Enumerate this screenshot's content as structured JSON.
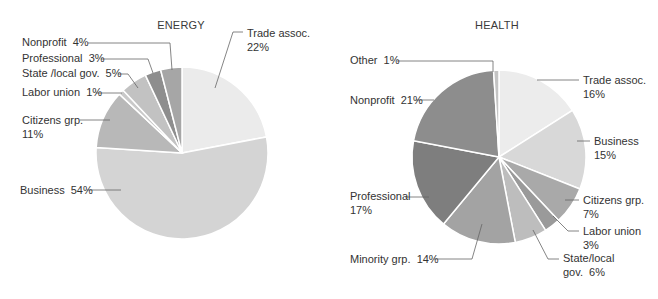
{
  "chart_data": [
    {
      "type": "pie",
      "title": "ENERGY",
      "center": [
        182,
        153
      ],
      "radius": 86,
      "start_angle_deg": 0,
      "direction": "clockwise",
      "slices": [
        {
          "label": "Trade assoc.",
          "value": 22,
          "color": "#ebebeb",
          "text": [
            "Trade assoc.",
            "22%"
          ],
          "label_pos": [
            247,
            37
          ],
          "leader": [
            [
              243,
              32
            ],
            [
              233,
              32
            ],
            [
              215,
              88
            ]
          ]
        },
        {
          "label": "Business",
          "value": 54,
          "color": "#d4d4d4",
          "text": [
            "Business  54%"
          ],
          "label_pos": [
            20,
            194
          ],
          "leader": [
            [
              87,
              190
            ],
            [
              121,
              190
            ]
          ]
        },
        {
          "label": "Citizens grp.",
          "value": 11,
          "color": "#b8b8b8",
          "text": [
            "Citizens grp.",
            "11%"
          ],
          "label_pos": [
            22,
            124
          ],
          "leader": [
            [
              80,
              120
            ],
            [
              110,
              120
            ]
          ]
        },
        {
          "label": "Labor union",
          "value": 1,
          "color": "#c9c9c9",
          "text": [
            "Labor union  1%"
          ],
          "label_pos": [
            22,
            96
          ],
          "leader": [
            [
              96,
              93
            ],
            [
              122,
              93
            ]
          ]
        },
        {
          "label": "State /local gov.",
          "value": 5,
          "color": "#c2c2c2",
          "text": [
            "State /local gov.  5%"
          ],
          "label_pos": [
            22,
            77
          ],
          "leader": [
            [
              118,
              74
            ],
            [
              128,
              74
            ],
            [
              138,
              88
            ]
          ]
        },
        {
          "label": "Professional",
          "value": 3,
          "color": "#8e8e8e",
          "text": [
            "Professional  3%"
          ],
          "label_pos": [
            22,
            62
          ],
          "leader": [
            [
              101,
              59
            ],
            [
              148,
              59
            ],
            [
              153,
              73
            ]
          ]
        },
        {
          "label": "Nonprofit",
          "value": 4,
          "color": "#a6a6a6",
          "text": [
            "Nonprofit  4%"
          ],
          "label_pos": [
            22,
            46
          ],
          "leader": [
            [
              88,
              43
            ],
            [
              170,
              43
            ],
            [
              172,
              70
            ]
          ]
        }
      ]
    },
    {
      "type": "pie",
      "title": "HEALTH",
      "center": [
        499,
        157
      ],
      "radius": 87,
      "start_angle_deg": 0,
      "direction": "clockwise",
      "slices": [
        {
          "label": "Trade assoc.",
          "value": 16,
          "color": "#ececec",
          "text": [
            "Trade assoc.",
            "16%"
          ],
          "label_pos": [
            583,
            84
          ],
          "leader": [
            [
              579,
              80
            ],
            [
              537,
              80
            ]
          ]
        },
        {
          "label": "Business",
          "value": 15,
          "color": "#d8d8d8",
          "text": [
            "Business",
            "15%"
          ],
          "label_pos": [
            594,
            145
          ],
          "leader": [
            [
              590,
              141
            ],
            [
              577,
              141
            ]
          ]
        },
        {
          "label": "Citizens grp.",
          "value": 7,
          "color": "#a9a9a9",
          "text": [
            "Citizens grp.",
            "7%"
          ],
          "label_pos": [
            583,
            204
          ],
          "leader": [
            [
              579,
              200
            ],
            [
              565,
              200
            ]
          ]
        },
        {
          "label": "Labor union",
          "value": 3,
          "color": "#9a9a9a",
          "text": [
            "Labor union",
            "3%"
          ],
          "label_pos": [
            583,
            235
          ],
          "leader": [
            [
              579,
              231
            ],
            [
              568,
              231
            ],
            [
              553,
              216
            ]
          ]
        },
        {
          "label": "State/local gov.",
          "value": 6,
          "color": "#bdbdbd",
          "text": [
            "State/local",
            "gov.  6%"
          ],
          "label_pos": [
            563,
            262
          ],
          "leader": [
            [
              559,
              259
            ],
            [
              548,
              259
            ],
            [
              533,
              230
            ]
          ]
        },
        {
          "label": "Minority grp.",
          "value": 14,
          "color": "#a3a3a3",
          "text": [
            "Minority grp.  14%"
          ],
          "label_pos": [
            350,
            263
          ],
          "leader": [
            [
              434,
              259
            ],
            [
              472,
              259
            ],
            [
              482,
              224
            ]
          ]
        },
        {
          "label": "Professional",
          "value": 17,
          "color": "#7e7e7e",
          "text": [
            "Professional",
            "17%"
          ],
          "label_pos": [
            350,
            200
          ],
          "leader": [
            [
              405,
              197
            ],
            [
              429,
              197
            ]
          ]
        },
        {
          "label": "Nonprofit",
          "value": 21,
          "color": "#8d8d8d",
          "text": [
            "Nonprofit  21%"
          ],
          "label_pos": [
            350,
            104
          ],
          "leader": [
            [
              416,
              100
            ],
            [
              434,
              100
            ]
          ]
        },
        {
          "label": "Other",
          "value": 1,
          "color": "#c4c4c4",
          "text": [
            "Other  1%"
          ],
          "label_pos": [
            350,
            64
          ],
          "leader": [
            [
              397,
              61
            ],
            [
              493,
              61
            ],
            [
              493,
              72
            ]
          ]
        }
      ]
    }
  ],
  "titles": {
    "energy": "ENERGY",
    "health": "HEALTH"
  },
  "title_pos": {
    "energy": [
      181,
      29
    ],
    "health": [
      497,
      29
    ]
  }
}
